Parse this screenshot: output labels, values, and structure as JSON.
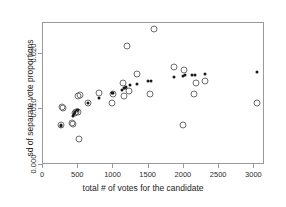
{
  "chart_data": {
    "type": "scatter",
    "title": "",
    "subtitle": "",
    "xlabel": "total # of votes for the candidate",
    "ylabel": "sd of separate vote proportions",
    "xlim": [
      0,
      3150
    ],
    "ylim": [
      0.0,
      0.0255
    ],
    "xticks": [
      0,
      500,
      1000,
      1500,
      2000,
      2500,
      3000
    ],
    "xticklabels": [
      "0",
      "500",
      "1000",
      "1500",
      "2000",
      "2500",
      "3000"
    ],
    "yticks": [
      0.0,
      0.01,
      0.02
    ],
    "yticklabels": [
      "0.000",
      "0.010",
      "0.020"
    ],
    "grid": false,
    "legend": null,
    "series": [
      {
        "name": "observed sd",
        "marker": "open-circle",
        "color": "#6e6e6e",
        "points": [
          [
            255,
            0.0072
          ],
          [
            270,
            0.01035
          ],
          [
            290,
            0.0103
          ],
          [
            405,
            0.0076
          ],
          [
            430,
            0.00745
          ],
          [
            450,
            0.0093
          ],
          [
            470,
            0.00955
          ],
          [
            495,
            0.0096
          ],
          [
            500,
            0.01245
          ],
          [
            510,
            0.0047
          ],
          [
            520,
            0.0125
          ],
          [
            640,
            0.0112
          ],
          [
            790,
            0.013
          ],
          [
            975,
            0.01105
          ],
          [
            990,
            0.0127
          ],
          [
            1140,
            0.0147
          ],
          [
            1155,
            0.0124
          ],
          [
            1195,
            0.02135
          ],
          [
            1215,
            0.0132
          ],
          [
            1340,
            0.0164
          ],
          [
            1520,
            0.0127
          ],
          [
            1570,
            0.0244
          ],
          [
            1860,
            0.0176
          ],
          [
            1980,
            0.0072
          ],
          [
            2000,
            0.0171
          ],
          [
            2145,
            0.0128
          ],
          [
            2170,
            0.0147
          ],
          [
            2305,
            0.01515
          ],
          [
            3030,
            0.0112
          ]
        ]
      },
      {
        "name": "expected sd",
        "marker": "filled-circle",
        "color": "#1a1a1a",
        "points": [
          [
            250,
            0.00705
          ],
          [
            262,
            0.00715
          ],
          [
            420,
            0.0088
          ],
          [
            440,
            0.00915
          ],
          [
            460,
            0.00955
          ],
          [
            480,
            0.00985
          ],
          [
            500,
            0.00995
          ],
          [
            640,
            0.01115
          ],
          [
            790,
            0.01205
          ],
          [
            980,
            0.01285
          ],
          [
            1000,
            0.0129
          ],
          [
            1125,
            0.01355
          ],
          [
            1145,
            0.01375
          ],
          [
            1160,
            0.01385
          ],
          [
            1180,
            0.014
          ],
          [
            1235,
            0.0143
          ],
          [
            1340,
            0.01455
          ],
          [
            1495,
            0.01505
          ],
          [
            1530,
            0.0151
          ],
          [
            1865,
            0.0158
          ],
          [
            1985,
            0.01605
          ],
          [
            2020,
            0.0161
          ],
          [
            2115,
            0.01615
          ],
          [
            2150,
            0.0162
          ],
          [
            2300,
            0.0164
          ],
          [
            3035,
            0.01675
          ]
        ]
      }
    ]
  }
}
